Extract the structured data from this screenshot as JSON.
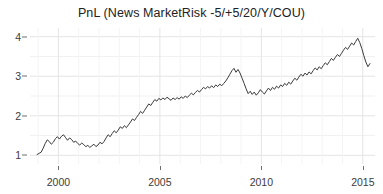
{
  "chart_data": {
    "type": "line",
    "title": "PnL (News MarketRisk -5/+5/20/Y/COU)",
    "xlabel": "",
    "ylabel": "",
    "xlim": [
      1998.6,
      2015.6
    ],
    "ylim": [
      0.78,
      4.22
    ],
    "grid": true,
    "legend_position": "none",
    "x_ticks": [
      2000,
      2005,
      2010,
      2015
    ],
    "x_tick_labels": [
      "2000",
      "2005",
      "2010",
      "2015"
    ],
    "y_ticks": [
      1,
      2,
      3,
      4
    ],
    "y_tick_labels": [
      "1",
      "2",
      "3",
      "4"
    ],
    "line_color": "#3a3a3a",
    "line_width": 1.0,
    "background_color": "#ffffff",
    "gridline_color": "#ececec",
    "series": [
      {
        "name": "PnL",
        "x": [
          1998.95,
          1999.05,
          1999.15,
          1999.25,
          1999.35,
          1999.45,
          1999.55,
          1999.65,
          1999.75,
          1999.85,
          1999.95,
          2000.05,
          2000.15,
          2000.25,
          2000.35,
          2000.45,
          2000.55,
          2000.65,
          2000.75,
          2000.85,
          2000.95,
          2001.05,
          2001.15,
          2001.25,
          2001.35,
          2001.45,
          2001.55,
          2001.65,
          2001.75,
          2001.85,
          2001.95,
          2002.05,
          2002.15,
          2002.25,
          2002.35,
          2002.45,
          2002.55,
          2002.65,
          2002.75,
          2002.85,
          2002.95,
          2003.05,
          2003.15,
          2003.25,
          2003.35,
          2003.45,
          2003.55,
          2003.65,
          2003.75,
          2003.85,
          2003.95,
          2004.05,
          2004.15,
          2004.25,
          2004.35,
          2004.45,
          2004.55,
          2004.65,
          2004.75,
          2004.85,
          2004.95,
          2005.05,
          2005.15,
          2005.25,
          2005.35,
          2005.45,
          2005.55,
          2005.65,
          2005.75,
          2005.85,
          2005.95,
          2006.05,
          2006.15,
          2006.25,
          2006.35,
          2006.45,
          2006.55,
          2006.65,
          2006.75,
          2006.85,
          2006.95,
          2007.05,
          2007.15,
          2007.25,
          2007.35,
          2007.45,
          2007.55,
          2007.65,
          2007.75,
          2007.85,
          2007.95,
          2008.05,
          2008.15,
          2008.25,
          2008.35,
          2008.45,
          2008.55,
          2008.65,
          2008.75,
          2008.85,
          2008.95,
          2009.05,
          2009.15,
          2009.25,
          2009.35,
          2009.45,
          2009.55,
          2009.65,
          2009.75,
          2009.85,
          2009.95,
          2010.05,
          2010.15,
          2010.25,
          2010.35,
          2010.45,
          2010.55,
          2010.65,
          2010.75,
          2010.85,
          2010.95,
          2011.05,
          2011.15,
          2011.25,
          2011.35,
          2011.45,
          2011.55,
          2011.65,
          2011.75,
          2011.85,
          2011.95,
          2012.05,
          2012.15,
          2012.25,
          2012.35,
          2012.45,
          2012.55,
          2012.65,
          2012.75,
          2012.85,
          2012.95,
          2013.05,
          2013.15,
          2013.25,
          2013.35,
          2013.45,
          2013.55,
          2013.65,
          2013.75,
          2013.85,
          2013.95,
          2014.05,
          2014.15,
          2014.25,
          2014.35,
          2014.45,
          2014.55,
          2014.65,
          2014.75,
          2014.85,
          2014.95,
          2015.05,
          2015.15,
          2015.25,
          2015.35
        ],
        "y": [
          1.02,
          1.05,
          1.08,
          1.18,
          1.3,
          1.39,
          1.35,
          1.28,
          1.33,
          1.42,
          1.47,
          1.41,
          1.48,
          1.52,
          1.45,
          1.38,
          1.44,
          1.4,
          1.33,
          1.36,
          1.3,
          1.26,
          1.31,
          1.27,
          1.22,
          1.25,
          1.2,
          1.24,
          1.28,
          1.22,
          1.26,
          1.33,
          1.29,
          1.35,
          1.44,
          1.52,
          1.47,
          1.55,
          1.62,
          1.57,
          1.64,
          1.72,
          1.68,
          1.75,
          1.7,
          1.77,
          1.84,
          1.92,
          1.88,
          1.96,
          2.03,
          2.11,
          2.06,
          2.14,
          2.22,
          2.3,
          2.26,
          2.34,
          2.41,
          2.37,
          2.44,
          2.4,
          2.45,
          2.41,
          2.47,
          2.43,
          2.39,
          2.45,
          2.41,
          2.46,
          2.42,
          2.48,
          2.44,
          2.5,
          2.46,
          2.52,
          2.57,
          2.53,
          2.59,
          2.64,
          2.6,
          2.66,
          2.72,
          2.68,
          2.74,
          2.7,
          2.76,
          2.71,
          2.78,
          2.74,
          2.8,
          2.76,
          2.82,
          2.88,
          2.96,
          3.05,
          3.14,
          3.2,
          3.1,
          3.17,
          3.08,
          2.95,
          2.82,
          2.68,
          2.56,
          2.62,
          2.54,
          2.6,
          2.52,
          2.58,
          2.66,
          2.6,
          2.55,
          2.63,
          2.7,
          2.64,
          2.72,
          2.67,
          2.75,
          2.7,
          2.78,
          2.74,
          2.82,
          2.77,
          2.85,
          2.8,
          2.88,
          2.95,
          2.9,
          2.98,
          3.05,
          3.0,
          3.08,
          3.03,
          3.11,
          3.06,
          3.14,
          3.21,
          3.16,
          3.24,
          3.19,
          3.27,
          3.34,
          3.29,
          3.37,
          3.45,
          3.4,
          3.48,
          3.55,
          3.5,
          3.58,
          3.66,
          3.73,
          3.68,
          3.76,
          3.84,
          3.79,
          3.88,
          3.96,
          3.85,
          3.7,
          3.52,
          3.36,
          3.24,
          3.32
        ]
      }
    ]
  }
}
